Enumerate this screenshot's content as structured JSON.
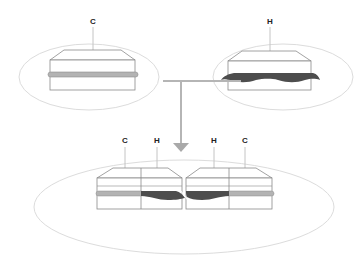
{
  "diagram": {
    "type": "assembly-illustration",
    "top_left": {
      "label": "C",
      "band_style": "straight-rounded-bar",
      "band_color": "#b3b3b3"
    },
    "top_right": {
      "label": "H",
      "band_style": "wavy-dark-band",
      "band_color": "#4d4d4d"
    },
    "connector": {
      "description": "T-junction connecting top two parts, arrow pointing down to combined assembly",
      "color": "#b5b5b5"
    },
    "bottom": {
      "labels": [
        "C",
        "H",
        "H",
        "C"
      ],
      "description": "Combined assembly: C and H segments joined in pairs"
    },
    "colors": {
      "ellipse_outline": "#dcdcdc",
      "block_outline": "#8a8a8a",
      "light_band": "#b3b3b3",
      "dark_band": "#4d4d4d",
      "connector": "#b5b5b5",
      "label": "#222222"
    }
  }
}
